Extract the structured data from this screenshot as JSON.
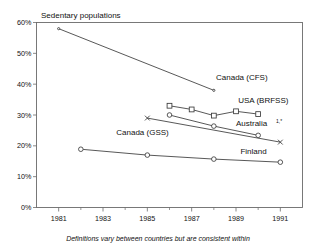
{
  "chart_data": {
    "type": "line",
    "title": "Sedentary populations",
    "xlabel": "",
    "ylabel": "",
    "xlim": [
      1980,
      1992
    ],
    "ylim": [
      0,
      60
    ],
    "grid": false,
    "legend_position": "inline-labels",
    "y_ticks": [
      "0%",
      "10%",
      "20%",
      "30%",
      "40%",
      "50%",
      "60%"
    ],
    "y_tick_values": [
      0,
      10,
      20,
      30,
      40,
      50,
      60
    ],
    "x_ticks": [
      "1981",
      "1983",
      "1985",
      "1987",
      "1989",
      "1991"
    ],
    "x_tick_values": [
      1981,
      1983,
      1985,
      1987,
      1989,
      1991
    ],
    "x_minor_ticks": [
      1980,
      1982,
      1984,
      1986,
      1988,
      1990,
      1992
    ],
    "footnote": "Definitions vary between countries but are consistent within",
    "series": [
      {
        "name": "Canada (CFS)",
        "label": "Canada (CFS)",
        "marker": "point",
        "x": [
          1981,
          1988
        ],
        "values": [
          58,
          38
        ]
      },
      {
        "name": "USA (BRFSS)",
        "label": "USA (BRFSS)",
        "marker": "square",
        "x": [
          1986,
          1987,
          1988,
          1989,
          1990
        ],
        "values": [
          33,
          31.8,
          29.8,
          31.2,
          30.3
        ]
      },
      {
        "name": "Canada (GSS)",
        "label": "Canada (GSS)",
        "marker": "circle",
        "x": [
          1986,
          1988,
          1990
        ],
        "values": [
          30,
          26.4,
          23.4
        ]
      },
      {
        "name": "Australia",
        "label": "Australia",
        "label_superscript": "1,*",
        "marker": "x",
        "x": [
          1985,
          1991
        ],
        "values": [
          29,
          21.2
        ]
      },
      {
        "name": "Finland",
        "label": "Finland",
        "marker": "circle",
        "x": [
          1982,
          1985,
          1988,
          1991
        ],
        "values": [
          18.9,
          17,
          15.7,
          14.7
        ]
      }
    ],
    "series_label_positions": [
      {
        "name": "Canada (CFS)",
        "x": 1988.1,
        "y": 41.5
      },
      {
        "name": "USA (BRFSS)",
        "x": 1989.1,
        "y": 33.8
      },
      {
        "name": "Australia",
        "x": 1989.0,
        "y": 26.3
      },
      {
        "name": "Canada (GSS)",
        "x": 1983.6,
        "y": 23.6
      },
      {
        "name": "Finland",
        "x": 1989.2,
        "y": 17.4
      }
    ]
  }
}
